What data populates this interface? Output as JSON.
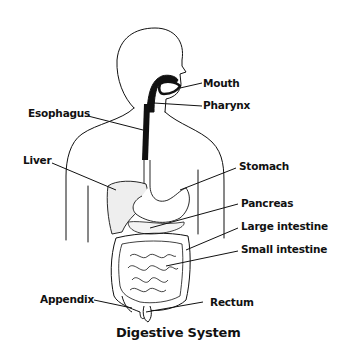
{
  "diagram": {
    "title": "Digestive System",
    "labels": {
      "mouth": "Mouth",
      "pharynx": "Pharynx",
      "esophagus": "Esophagus",
      "liver": "Liver",
      "stomach": "Stomach",
      "pancreas": "Pancreas",
      "large_intestine": "Large intestine",
      "small_intestine": "Small intestine",
      "appendix": "Appendix",
      "rectum": "Rectum"
    },
    "colors": {
      "line": "#111111",
      "background": "#ffffff"
    }
  }
}
